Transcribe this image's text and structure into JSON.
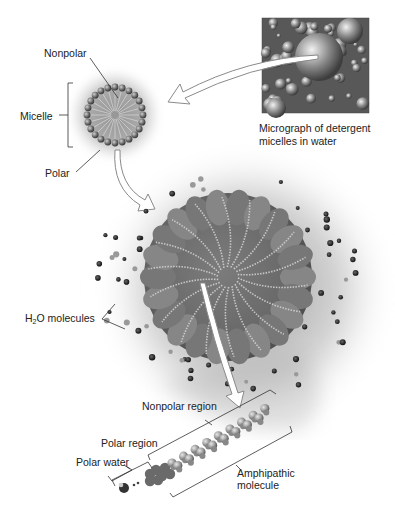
{
  "labels": {
    "nonpolar": "Nonpolar",
    "micelle": "Micelle",
    "polar": "Polar",
    "micrograph_line1": "Micrograph of detergent",
    "micrograph_line2": "micelles in water",
    "h2o_prefix": "H",
    "h2o_sub": "2",
    "h2o_suffix": "O molecules",
    "nonpolar_region": "Nonpolar region",
    "polar_region": "Polar region",
    "polar_water": "Polar water",
    "amphipathic_line1": "Amphipathic",
    "amphipathic_line2": "molecule"
  },
  "elements": {
    "micrograph": "micrograph-image",
    "micelle_diagram": "micelle-ring-diagram",
    "micelle_3d": "micelle-3d-model",
    "molecule": "amphipathic-molecule-model"
  },
  "colors": {
    "shadow": "#9a9a9a",
    "bead": "#6b6b6b",
    "micrograph_bg": "#5a5a5a",
    "arrow_fill": "#ffffff",
    "arrow_stroke": "#8a8a8a",
    "text": "#222222"
  }
}
